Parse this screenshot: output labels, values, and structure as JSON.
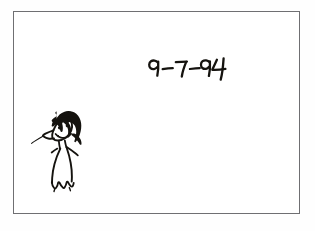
{
  "document": {
    "kind": "hand-drawn-sketch",
    "media": "ink on white paper",
    "background_color": "#ffffff",
    "ink_color": "#15130f",
    "frame_color": "#6f6f72"
  },
  "frame": {
    "name": "border-rectangle",
    "left": 13,
    "top": 11,
    "width": 287,
    "height": 203
  },
  "annotations": {
    "date": {
      "text": "9-7-94",
      "style": "handwritten",
      "position": "upper-right",
      "left": 146,
      "top": 52
    }
  },
  "figure": {
    "name": "cartoon-woman",
    "position": "lower-left",
    "parts": [
      "hair",
      "face",
      "eyes",
      "nose",
      "smile",
      "neck",
      "arms",
      "dress",
      "hem"
    ]
  }
}
